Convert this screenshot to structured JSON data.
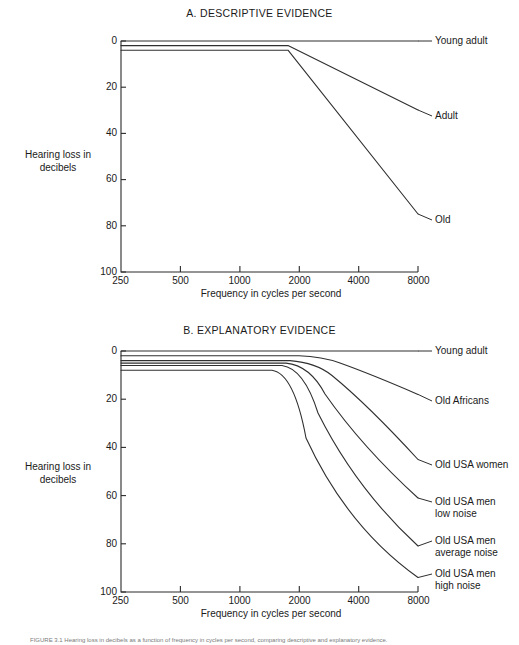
{
  "figure": {
    "caption": "FIGURE 3.1  Hearing loss in decibels as a function of frequency in cycles per second, comparing descriptive and explanatory evidence."
  },
  "panels": [
    {
      "id": "a",
      "title": "A. DESCRIPTIVE EVIDENCE",
      "ylabel": "Hearing loss\nin decibels",
      "xlabel": "Frequency in cycles per second",
      "yticks": [
        "0",
        "20",
        "40",
        "60",
        "80",
        "100"
      ],
      "xticks": [
        "250",
        "500",
        "1000",
        "2000",
        "4000",
        "8000"
      ],
      "series_labels": [
        "Young adult",
        "Adult",
        "Old"
      ]
    },
    {
      "id": "b",
      "title": "B. EXPLANATORY EVIDENCE",
      "ylabel": "Hearing loss\nin decibels",
      "xlabel": "Frequency in cycles per second",
      "yticks": [
        "0",
        "20",
        "40",
        "60",
        "80",
        "100"
      ],
      "xticks": [
        "250",
        "500",
        "1000",
        "2000",
        "4000",
        "8000"
      ],
      "series_labels": [
        "Young adult",
        "Old Africans",
        "Old USA women",
        "Old USA men\nlow noise",
        "Old USA men\naverage noise",
        "Old USA men\nhigh noise"
      ]
    }
  ],
  "chart_data": [
    {
      "type": "line",
      "title": "A. DESCRIPTIVE EVIDENCE",
      "xlabel": "Frequency in cycles per second",
      "ylabel": "Hearing loss in decibels",
      "xscale": "log",
      "xticks": [
        250,
        500,
        1000,
        2000,
        4000,
        8000
      ],
      "xlim": [
        125,
        8000
      ],
      "ylim": [
        0,
        100
      ],
      "yticks": [
        0,
        20,
        40,
        60,
        80,
        100
      ],
      "y_inverted": true,
      "grid": false,
      "legend": "inline-right-labels",
      "series": [
        {
          "name": "Young adult",
          "x": [
            125,
            250,
            500,
            1000,
            2000,
            4000,
            8000
          ],
          "values": [
            0,
            0,
            0,
            0,
            0,
            0,
            0
          ]
        },
        {
          "name": "Adult",
          "x": [
            125,
            250,
            500,
            850,
            8000
          ],
          "values": [
            2,
            2,
            2,
            2,
            30
          ]
        },
        {
          "name": "Old",
          "x": [
            125,
            250,
            500,
            850,
            8000
          ],
          "values": [
            4,
            4,
            4,
            4,
            75
          ]
        }
      ]
    },
    {
      "type": "line",
      "title": "B. EXPLANATORY EVIDENCE",
      "xlabel": "Frequency in cycles per second",
      "ylabel": "Hearing loss in decibels",
      "xscale": "log",
      "xticks": [
        250,
        500,
        1000,
        2000,
        4000,
        8000
      ],
      "xlim": [
        125,
        8000
      ],
      "ylim": [
        0,
        100
      ],
      "yticks": [
        0,
        20,
        40,
        60,
        80,
        100
      ],
      "y_inverted": true,
      "grid": false,
      "legend": "inline-right-labels",
      "series": [
        {
          "name": "Young adult",
          "x": [
            125,
            500,
            1000,
            2000,
            4000,
            8000
          ],
          "values": [
            0,
            0,
            0,
            0,
            0,
            0
          ]
        },
        {
          "name": "Old Africans",
          "x": [
            125,
            1000,
            1500,
            2000,
            4000,
            8000
          ],
          "values": [
            2,
            2,
            3,
            5,
            11,
            18
          ]
        },
        {
          "name": "Old USA women",
          "x": [
            125,
            900,
            1300,
            2000,
            4000,
            8000
          ],
          "values": [
            4,
            4,
            6,
            12,
            27,
            45
          ]
        },
        {
          "name": "Old USA men low noise",
          "x": [
            125,
            850,
            1200,
            2000,
            4000,
            8000
          ],
          "values": [
            5,
            5,
            8,
            18,
            38,
            61
          ]
        },
        {
          "name": "Old USA men average noise",
          "x": [
            125,
            800,
            1100,
            2000,
            4000,
            8000
          ],
          "values": [
            6,
            6,
            10,
            26,
            52,
            81
          ]
        },
        {
          "name": "Old USA men high noise",
          "x": [
            125,
            700,
            1000,
            2000,
            4000,
            8000
          ],
          "values": [
            8,
            8,
            14,
            36,
            66,
            94
          ]
        }
      ]
    }
  ]
}
